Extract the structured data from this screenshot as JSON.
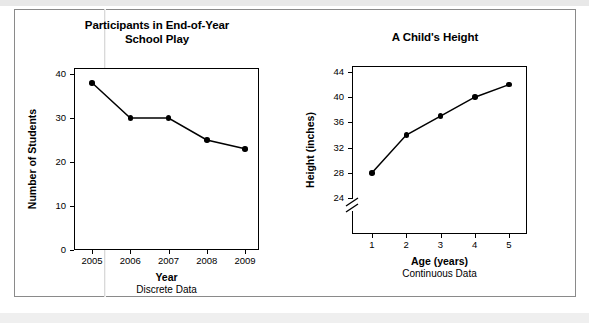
{
  "page": {
    "background_color": "#ffffff",
    "sheet_border_color": "#8a8a8a"
  },
  "chart_data": [
    {
      "id": "participants-play",
      "type": "line",
      "title": "Participants in End-of-Year School Play",
      "title_line1": "Participants in End-of-Year",
      "title_line2": "School Play",
      "xlabel": "Year",
      "xsublabel": "Discrete Data",
      "ylabel": "Number of Students",
      "categories": [
        "2005",
        "2006",
        "2007",
        "2008",
        "2009"
      ],
      "x": [
        2005,
        2006,
        2007,
        2008,
        2009
      ],
      "values": [
        38,
        30,
        30,
        25,
        23
      ],
      "xticklabels": [
        "2005",
        "2006",
        "2007",
        "2008",
        "2009"
      ],
      "yticklabels": [
        "0",
        "10",
        "20",
        "30",
        "40"
      ],
      "yticks": [
        0,
        10,
        20,
        30,
        40
      ],
      "ylim": [
        0,
        40
      ],
      "grid": false,
      "legend": "none",
      "marker_color": "#000000",
      "line_color": "#000000"
    },
    {
      "id": "child-height",
      "type": "line",
      "title": "A Child's Height",
      "xlabel": "Age (years)",
      "xsublabel": "Continuous Data",
      "ylabel": "Height (inches)",
      "categories": [
        "1",
        "2",
        "3",
        "4",
        "5"
      ],
      "x": [
        1,
        2,
        3,
        4,
        5
      ],
      "values": [
        28,
        34,
        37,
        40,
        42
      ],
      "xticklabels": [
        "1",
        "2",
        "3",
        "4",
        "5"
      ],
      "yticklabels": [
        "24",
        "28",
        "32",
        "36",
        "40",
        "44"
      ],
      "yticks": [
        24,
        28,
        32,
        36,
        40,
        44
      ],
      "ylim": [
        24,
        44
      ],
      "y_axis_break": true,
      "grid": false,
      "legend": "none",
      "marker_color": "#000000",
      "line_color": "#000000"
    }
  ]
}
